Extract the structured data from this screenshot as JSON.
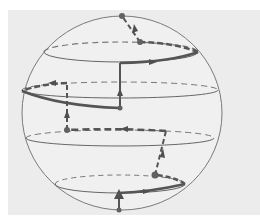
{
  "diagram": {
    "type": "sphere-path",
    "colors": {
      "background": "#ffffff",
      "panel": "#ececec",
      "outline": "#7a7a7a",
      "thin_line": "#6e6e6e",
      "path": "#5a5a5a",
      "node": "#616161"
    },
    "sphere": {
      "cx": 122,
      "cy": 113,
      "rx": 100,
      "ry": 97
    },
    "latitude_rings": [
      {
        "name": "ring-1",
        "cx": 121,
        "cy": 52,
        "rx": 77,
        "ry": 10
      },
      {
        "name": "ring-2",
        "cx": 120,
        "cy": 90,
        "rx": 98,
        "ry": 8
      },
      {
        "name": "ring-3",
        "cx": 120,
        "cy": 138,
        "rx": 94,
        "ry": 8
      },
      {
        "name": "ring-4",
        "cx": 120,
        "cy": 184,
        "rx": 65,
        "ry": 9
      }
    ],
    "nodes": [
      {
        "name": "start-node",
        "x": 119,
        "y": 210
      },
      {
        "name": "node-ring4-back",
        "x": 155,
        "y": 175
      },
      {
        "name": "node-ring3-back",
        "x": 67,
        "y": 130
      },
      {
        "name": "node-ring2-front",
        "x": 120,
        "y": 108
      },
      {
        "name": "node-ring1-back",
        "x": 140,
        "y": 42
      },
      {
        "name": "end-node-pole",
        "x": 122,
        "y": 16
      }
    ]
  }
}
